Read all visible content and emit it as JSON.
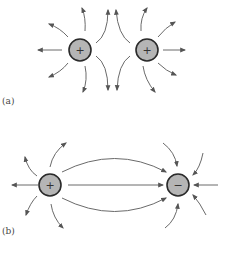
{
  "figure": {
    "panels": [
      {
        "label": "(a)",
        "description": "Two positive charges; field lines repel",
        "charges": [
          {
            "sign": "+",
            "type": "positive"
          },
          {
            "sign": "+",
            "type": "positive"
          }
        ]
      },
      {
        "label": "(b)",
        "description": "Positive and negative charge; field lines run from + to −",
        "charges": [
          {
            "sign": "+",
            "type": "positive"
          },
          {
            "sign": "−",
            "type": "negative"
          }
        ]
      }
    ],
    "colors": {
      "charge_fill": "#b5b5b5",
      "charge_stroke": "#2a2a2a",
      "field_line": "#6a6a6a"
    }
  }
}
